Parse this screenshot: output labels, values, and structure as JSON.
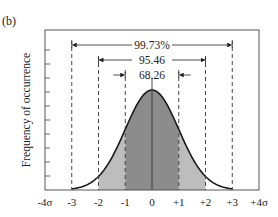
{
  "panel_label": "(b)",
  "chart_data": {
    "type": "area",
    "title": "",
    "xlabel": "",
    "ylabel": "Frequency of occurrence",
    "x_tick_labels": [
      "-4σ",
      "-3",
      "-2",
      "-1",
      "0",
      "+1",
      "+2",
      "+3",
      "+4σ"
    ],
    "x_ticks": [
      -4,
      -3,
      -2,
      -1,
      0,
      1,
      2,
      3,
      4
    ],
    "xlim": [
      -4,
      4
    ],
    "y_ticks_count": 10,
    "grid": false,
    "distribution": "normal",
    "mean": 0,
    "sigma": 1,
    "shaded_regions": [
      {
        "range": [
          -1,
          1
        ],
        "shade": "dark",
        "color": "#8c8c8c"
      },
      {
        "range": [
          -2,
          -1
        ],
        "shade": "light",
        "color": "#bdbdbd"
      },
      {
        "range": [
          1,
          2
        ],
        "shade": "light",
        "color": "#bdbdbd"
      }
    ],
    "dashed_lines_at": [
      -3,
      -2,
      -1,
      1,
      2,
      3
    ],
    "center_line_at": 0,
    "annotations": [
      {
        "label": "99.73%",
        "range": [
          -3,
          3
        ]
      },
      {
        "label": "95.46",
        "range": [
          -2,
          2
        ]
      },
      {
        "label": "68.26",
        "range": [
          -1,
          1
        ]
      }
    ]
  }
}
